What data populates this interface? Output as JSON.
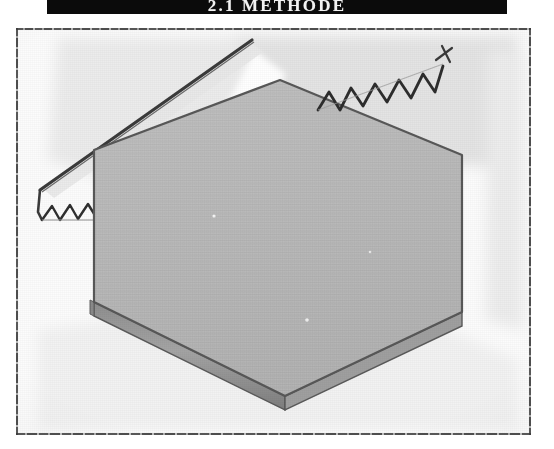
{
  "banner": {
    "label": "2.1 METHODE",
    "background_color": "#0b0b0b",
    "text_color": "#f2f2f2"
  },
  "figure": {
    "caption": "",
    "media_type": "scanned photocopy illustration",
    "paper_color": "#fcfcfc",
    "frame_color": "#3a3a3a",
    "objects": [
      {
        "name": "hexagonal-slab",
        "shape": "hexagon",
        "face_color": "#b9b9b9",
        "edge_color": "#9a9a9a",
        "outline_color": "#555555",
        "thickness_px": 14,
        "vertices": [
          [
            278,
            78
          ],
          [
            460,
            153
          ],
          [
            460,
            310
          ],
          [
            283,
            393
          ],
          [
            92,
            300
          ],
          [
            92,
            148
          ]
        ]
      },
      {
        "name": "saw-blade-left",
        "type": "straight-blade-with-teeth",
        "stroke_color": "#3c3c3c",
        "from": [
          248,
          38
        ],
        "to": [
          36,
          172
        ],
        "teeth_count": 5
      },
      {
        "name": "saw-blade-right",
        "type": "zigzag-teeth",
        "stroke_color": "#2f2f2f",
        "from": [
          318,
          105
        ],
        "to": [
          432,
          40
        ],
        "teeth_count": 8
      }
    ],
    "wash_patches": [
      {
        "name": "wash-top-left",
        "color": "#ededed"
      },
      {
        "name": "wash-top-right",
        "color": "#e6e6e6"
      },
      {
        "name": "wash-bottom",
        "color": "#f0f0f0"
      },
      {
        "name": "highlight-wedge",
        "color": "#ffffff"
      }
    ]
  }
}
